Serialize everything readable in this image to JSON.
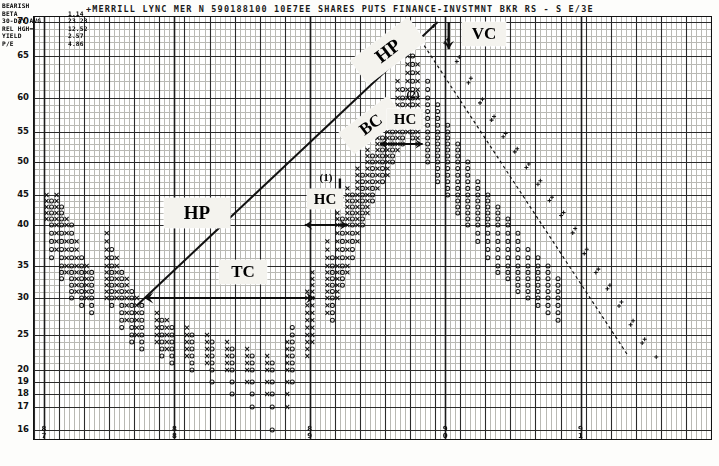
{
  "header": {
    "title": "+MERRILL LYNC   MER    N  590188100   10E7EE SHARES PUTS  FINANCE-INVSTMNT BKR RS - S   E/3E"
  },
  "info_box": {
    "lines": [
      {
        "label": "BEARISH",
        "value": ""
      },
      {
        "label": "BETA",
        "value": "1.14"
      },
      {
        "label": "30-DAY AVG",
        "value": "23.23"
      },
      {
        "label": "REL HGH=",
        "value": "12.52"
      },
      {
        "label": "YIELD",
        "value": "2.57"
      },
      {
        "label": "P/E",
        "value": "4.86"
      }
    ]
  },
  "y_axis": {
    "label": "",
    "ticks": [
      "70",
      "65",
      "60",
      "55",
      "50",
      "45",
      "40",
      "35",
      "30",
      "25",
      "20",
      "19",
      "18",
      "17",
      "16"
    ]
  },
  "x_axis": {
    "ticks": [
      "8\n7",
      "8\n8",
      "8\n9",
      "9\n0",
      "9\n1"
    ],
    "tick_labels": [
      "87",
      "88",
      "89",
      "90",
      "91"
    ]
  },
  "annotations": [
    {
      "name": "hp-left",
      "text": "HP",
      "style": "box",
      "rotation": 0
    },
    {
      "name": "hp-upper",
      "text": "HP",
      "style": "box",
      "rotation": -37
    },
    {
      "name": "bc",
      "text": "BC",
      "style": "box",
      "rotation": -37
    },
    {
      "name": "vc",
      "text": "VC",
      "style": "box",
      "rotation": 0
    },
    {
      "name": "tc",
      "text": "TC",
      "style": "box",
      "rotation": 0
    },
    {
      "name": "hc-upper",
      "text": "HC",
      "style": "box",
      "rotation": 0
    },
    {
      "name": "hc-lower",
      "text": "HC",
      "style": "box",
      "rotation": 0
    },
    {
      "name": "marker-1",
      "text": "(1)",
      "style": "plain",
      "rotation": 0
    },
    {
      "name": "marker-2",
      "text": "(2)",
      "style": "plain",
      "rotation": 0
    }
  ],
  "colors": {
    "grid_minor": "#b9b9b4",
    "grid_major": "#2a2a2a",
    "frame": "#111111",
    "mark": "#141414",
    "callout_bg": "#f4f3ee",
    "paper": "#fdfdfb"
  },
  "chart_data": {
    "type": "scatter",
    "chart_style": "point-and-figure",
    "title": "+MERRILL LYNC   MER    N  590188100   10E7EE SHARES PUTS  FINANCE-INVSTMNT BKR RS - S   E/3E",
    "xlabel": "",
    "ylabel": "Price",
    "ylim": [
      16,
      70
    ],
    "xlim": [
      0,
      135
    ],
    "grid": true,
    "legend": "none",
    "y_tick_values": [
      70,
      65,
      60,
      55,
      50,
      45,
      40,
      35,
      30,
      25,
      20,
      19,
      18,
      17,
      16
    ],
    "y_scale_note": "linear above 20; compressed single-unit rows 20,19,18,17,16 at bottom",
    "x_tick_labels": [
      "87",
      "88",
      "89",
      "90",
      "91"
    ],
    "x_tick_positions": [
      2,
      28,
      55,
      82,
      109
    ],
    "marks_legend": {
      "X": "rising column (demand)",
      "O": "falling column (supply)",
      "+": "trailing / projection marks"
    },
    "columns": [
      {
        "x": 2,
        "type": "X",
        "low": 41,
        "high": 45
      },
      {
        "x": 3,
        "type": "O",
        "low": 36,
        "high": 44
      },
      {
        "x": 4,
        "type": "X",
        "low": 37,
        "high": 45
      },
      {
        "x": 5,
        "type": "O",
        "low": 33,
        "high": 43
      },
      {
        "x": 6,
        "type": "X",
        "low": 34,
        "high": 41
      },
      {
        "x": 7,
        "type": "O",
        "low": 30,
        "high": 40
      },
      {
        "x": 8,
        "type": "X",
        "low": 31,
        "high": 38
      },
      {
        "x": 9,
        "type": "O",
        "low": 29,
        "high": 36
      },
      {
        "x": 10,
        "type": "X",
        "low": 30,
        "high": 35
      },
      {
        "x": 11,
        "type": "O",
        "low": 28,
        "high": 34
      },
      {
        "x": 14,
        "type": "X",
        "low": 30,
        "high": 39
      },
      {
        "x": 15,
        "type": "O",
        "low": 29,
        "high": 37
      },
      {
        "x": 16,
        "type": "X",
        "low": 30,
        "high": 36
      },
      {
        "x": 17,
        "type": "O",
        "low": 26,
        "high": 34
      },
      {
        "x": 18,
        "type": "X",
        "low": 27,
        "high": 33
      },
      {
        "x": 19,
        "type": "O",
        "low": 24,
        "high": 31
      },
      {
        "x": 20,
        "type": "X",
        "low": 25,
        "high": 30
      },
      {
        "x": 21,
        "type": "O",
        "low": 23,
        "high": 29
      },
      {
        "x": 24,
        "type": "X",
        "low": 24,
        "high": 28
      },
      {
        "x": 25,
        "type": "O",
        "low": 22,
        "high": 27
      },
      {
        "x": 26,
        "type": "X",
        "low": 23,
        "high": 27
      },
      {
        "x": 27,
        "type": "O",
        "low": 21,
        "high": 26
      },
      {
        "x": 30,
        "type": "X",
        "low": 22,
        "high": 26
      },
      {
        "x": 31,
        "type": "O",
        "low": 20,
        "high": 25
      },
      {
        "x": 34,
        "type": "X",
        "low": 21,
        "high": 25
      },
      {
        "x": 35,
        "type": "O",
        "low": 19,
        "high": 24
      },
      {
        "x": 38,
        "type": "X",
        "low": 20,
        "high": 24
      },
      {
        "x": 39,
        "type": "O",
        "low": 18,
        "high": 23
      },
      {
        "x": 42,
        "type": "X",
        "low": 19,
        "high": 23
      },
      {
        "x": 43,
        "type": "O",
        "low": 17,
        "high": 22
      },
      {
        "x": 46,
        "type": "X",
        "low": 18,
        "high": 22
      },
      {
        "x": 47,
        "type": "O",
        "low": 16,
        "high": 21
      },
      {
        "x": 50,
        "type": "X",
        "low": 17,
        "high": 24
      },
      {
        "x": 51,
        "type": "O",
        "low": 19,
        "high": 26
      },
      {
        "x": 54,
        "type": "X",
        "low": 22,
        "high": 31
      },
      {
        "x": 55,
        "type": "X",
        "low": 24,
        "high": 34
      },
      {
        "x": 58,
        "type": "X",
        "low": 28,
        "high": 38
      },
      {
        "x": 59,
        "type": "O",
        "low": 27,
        "high": 36
      },
      {
        "x": 60,
        "type": "X",
        "low": 30,
        "high": 42
      },
      {
        "x": 61,
        "type": "O",
        "low": 32,
        "high": 41
      },
      {
        "x": 62,
        "type": "X",
        "low": 34,
        "high": 46
      },
      {
        "x": 63,
        "type": "O",
        "low": 36,
        "high": 45
      },
      {
        "x": 64,
        "type": "X",
        "low": 38,
        "high": 49
      },
      {
        "x": 65,
        "type": "O",
        "low": 40,
        "high": 48
      },
      {
        "x": 66,
        "type": "X",
        "low": 42,
        "high": 52
      },
      {
        "x": 67,
        "type": "O",
        "low": 44,
        "high": 51
      },
      {
        "x": 68,
        "type": "X",
        "low": 46,
        "high": 55
      },
      {
        "x": 69,
        "type": "O",
        "low": 47,
        "high": 54
      },
      {
        "x": 70,
        "type": "X",
        "low": 48,
        "high": 58
      },
      {
        "x": 71,
        "type": "O",
        "low": 50,
        "high": 57
      },
      {
        "x": 72,
        "type": "X",
        "low": 52,
        "high": 62
      },
      {
        "x": 73,
        "type": "O",
        "low": 53,
        "high": 61
      },
      {
        "x": 74,
        "type": "X",
        "low": 55,
        "high": 66
      },
      {
        "x": 75,
        "type": "O",
        "low": 54,
        "high": 65
      },
      {
        "x": 76,
        "type": "X",
        "low": 53,
        "high": 64
      },
      {
        "x": 78,
        "type": "O",
        "low": 50,
        "high": 62
      },
      {
        "x": 80,
        "type": "O",
        "low": 47,
        "high": 59
      },
      {
        "x": 82,
        "type": "O",
        "low": 45,
        "high": 56
      },
      {
        "x": 84,
        "type": "O",
        "low": 42,
        "high": 53
      },
      {
        "x": 86,
        "type": "O",
        "low": 40,
        "high": 50
      },
      {
        "x": 88,
        "type": "O",
        "low": 38,
        "high": 47
      },
      {
        "x": 90,
        "type": "O",
        "low": 36,
        "high": 45
      },
      {
        "x": 92,
        "type": "O",
        "low": 34,
        "high": 43
      },
      {
        "x": 94,
        "type": "O",
        "low": 33,
        "high": 41
      },
      {
        "x": 96,
        "type": "O",
        "low": 31,
        "high": 39
      },
      {
        "x": 98,
        "type": "O",
        "low": 30,
        "high": 37
      },
      {
        "x": 100,
        "type": "O",
        "low": 29,
        "high": 36
      },
      {
        "x": 102,
        "type": "O",
        "low": 28,
        "high": 35
      },
      {
        "x": 104,
        "type": "O",
        "low": 27,
        "high": 33
      }
    ],
    "trend_lines": [
      {
        "name": "bullish-support-line",
        "x0": 20,
        "y0": 29,
        "x1": 80,
        "y1": 70,
        "style": "solid"
      },
      {
        "name": "bearish-resistance-line",
        "x0": 76,
        "y0": 68,
        "x1": 118,
        "y1": 22,
        "style": "dashed"
      }
    ],
    "annotations_detail": [
      {
        "label": "HP",
        "meaning": "horizontal price objective",
        "x": 27,
        "y": 41
      },
      {
        "label": "HP",
        "meaning": "horizontal price objective",
        "x": 66,
        "y": 62
      },
      {
        "label": "BC",
        "meaning": "bullish catapult",
        "x": 56,
        "y": 50
      },
      {
        "label": "VC",
        "meaning": "vertical count",
        "x": 88,
        "y": 68
      },
      {
        "label": "TC",
        "meaning": "triple count / time count",
        "x": 38,
        "y": 31
      },
      {
        "label": "HC",
        "meaning": "horizontal count",
        "x": 60,
        "y": 39
      },
      {
        "label": "HC",
        "meaning": "horizontal count",
        "x": 73,
        "y": 55
      },
      {
        "label": "(1)",
        "meaning": "count reference 1",
        "x": 58,
        "y": 45
      },
      {
        "label": "(2)",
        "meaning": "count reference 2",
        "x": 74,
        "y": 60
      }
    ]
  }
}
